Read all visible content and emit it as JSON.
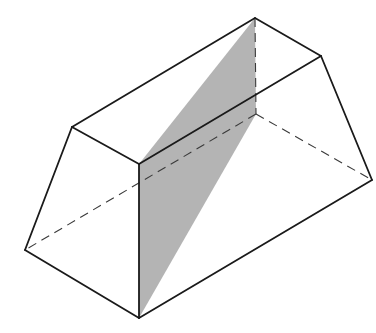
{
  "figure": {
    "title": "",
    "colors": {
      "edge": "#1a1a1a",
      "hidden_edge": "#3a3a3a",
      "section_fill": "#b4b4b4",
      "background": "#ffffff"
    },
    "vertices": {
      "A": [
        72,
        127
      ],
      "B": [
        255,
        18
      ],
      "C": [
        321,
        56
      ],
      "D": [
        139,
        164
      ],
      "E": [
        25,
        250
      ],
      "F": [
        139,
        318
      ],
      "G": [
        372,
        180
      ],
      "H": [
        256,
        114
      ]
    },
    "visible_edges": [
      [
        "A",
        "B"
      ],
      [
        "B",
        "C"
      ],
      [
        "C",
        "D"
      ],
      [
        "D",
        "A"
      ],
      [
        "A",
        "E"
      ],
      [
        "E",
        "F"
      ],
      [
        "F",
        "G"
      ],
      [
        "G",
        "C"
      ],
      [
        "D",
        "F"
      ]
    ],
    "hidden_edges": [
      [
        "B",
        "H"
      ],
      [
        "H",
        "E"
      ],
      [
        "H",
        "G"
      ]
    ],
    "shaded_section": [
      "D",
      "B",
      "H",
      "F"
    ]
  }
}
